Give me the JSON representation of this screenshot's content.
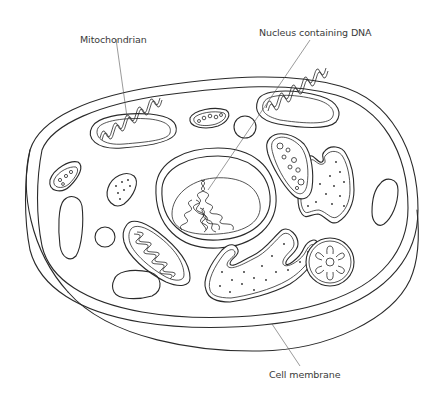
{
  "diagram": {
    "labels": {
      "mitochondrion": "Mitochondrian",
      "nucleus": "Nucleus containing DNA",
      "membrane": "Cell membrane"
    },
    "colors": {
      "line": "#2a2a2a",
      "leader": "#555555",
      "background": "#ffffff"
    }
  }
}
